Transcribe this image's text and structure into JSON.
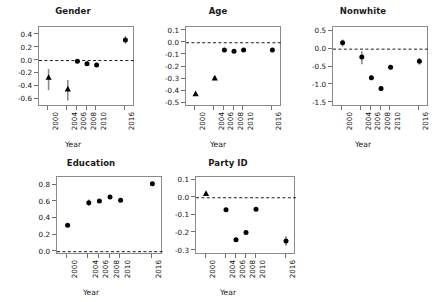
{
  "figure": {
    "xlabel": "Year",
    "years": [
      "2000",
      "2004",
      "2006",
      "2008",
      "2010",
      "2016"
    ]
  },
  "chart_data": [
    {
      "type": "scatter",
      "title": "Gender",
      "xlabel": "Year",
      "ylabel": "",
      "x": [
        2000,
        2004,
        2006,
        2008,
        2010,
        2016
      ],
      "categories": [
        "2000",
        "2004",
        "2006",
        "2008",
        "2010",
        "2016"
      ],
      "values": [
        -0.26,
        -0.44,
        -0.01,
        -0.05,
        -0.07,
        0.32
      ],
      "err_low": [
        -0.46,
        -0.62,
        -0.03,
        -0.08,
        -0.09,
        0.26
      ],
      "err_high": [
        -0.13,
        -0.3,
        0.01,
        -0.02,
        -0.05,
        0.38
      ],
      "markers": [
        "triangle",
        "triangle",
        "circle",
        "circle",
        "circle",
        "circle"
      ],
      "ylim": [
        -0.72,
        0.52
      ],
      "yticks": [
        "0.4",
        "0.2",
        "0.0",
        "-0.2",
        "-0.4",
        "-0.6"
      ],
      "ytick_values": [
        0.4,
        0.2,
        0.0,
        -0.2,
        -0.4,
        -0.6
      ],
      "reference_line": 0.0,
      "grid": false,
      "legend": "none"
    },
    {
      "type": "scatter",
      "title": "Age",
      "xlabel": "Year",
      "ylabel": "",
      "x": [
        2000,
        2004,
        2006,
        2008,
        2010,
        2016
      ],
      "categories": [
        "2000",
        "2004",
        "2006",
        "2008",
        "2010",
        "2016"
      ],
      "values": [
        -0.42,
        -0.29,
        -0.06,
        -0.07,
        -0.06,
        -0.06
      ],
      "err_low": [
        -0.435,
        -0.3,
        -0.072,
        -0.082,
        -0.072,
        -0.072
      ],
      "err_high": [
        -0.405,
        -0.28,
        -0.048,
        -0.058,
        -0.048,
        -0.048
      ],
      "markers": [
        "triangle",
        "triangle",
        "circle",
        "circle",
        "circle",
        "circle"
      ],
      "ylim": [
        -0.53,
        0.13
      ],
      "yticks": [
        "0.1",
        "0.0",
        "-0.1",
        "-0.2",
        "-0.3",
        "-0.4",
        "-0.5"
      ],
      "ytick_values": [
        0.1,
        0.0,
        -0.1,
        -0.2,
        -0.3,
        -0.4,
        -0.5
      ],
      "reference_line": 0.0,
      "grid": false,
      "legend": "none"
    },
    {
      "type": "scatter",
      "title": "Nonwhite",
      "xlabel": "Year",
      "ylabel": "",
      "x": [
        2000,
        2004,
        2006,
        2008,
        2010,
        2016
      ],
      "categories": [
        "2000",
        "2004",
        "2006",
        "2008",
        "2010",
        "2016"
      ],
      "values": [
        0.18,
        -0.22,
        -0.8,
        -1.1,
        -0.51,
        -0.34
      ],
      "err_low": [
        0.07,
        -0.42,
        -0.87,
        -1.17,
        -0.57,
        -0.44
      ],
      "err_high": [
        0.27,
        -0.06,
        -0.74,
        -1.03,
        -0.45,
        -0.25
      ],
      "markers": [
        "circle",
        "circle",
        "circle",
        "circle",
        "circle",
        "circle"
      ],
      "ylim": [
        -1.62,
        0.62
      ],
      "yticks": [
        "0.5",
        "0.0",
        "-0.5",
        "-1.0",
        "-1.5"
      ],
      "ytick_values": [
        0.5,
        0.0,
        -0.5,
        -1.0,
        -1.5
      ],
      "reference_line": 0.0,
      "grid": false,
      "legend": "none"
    },
    {
      "type": "scatter",
      "title": "Education",
      "xlabel": "Year",
      "ylabel": "",
      "x": [
        2000,
        2004,
        2006,
        2008,
        2010,
        2016
      ],
      "categories": [
        "2000",
        "2004",
        "2006",
        "2008",
        "2010",
        "2016"
      ],
      "values": [
        0.32,
        0.59,
        0.61,
        0.66,
        0.62,
        0.82
      ],
      "err_low": [
        0.3,
        0.55,
        0.59,
        0.64,
        0.6,
        0.8
      ],
      "err_high": [
        0.34,
        0.63,
        0.63,
        0.68,
        0.64,
        0.84
      ],
      "markers": [
        "circle",
        "circle",
        "circle",
        "circle",
        "circle",
        "circle"
      ],
      "ylim": [
        -0.04,
        0.9
      ],
      "yticks": [
        "0.8",
        "0.6",
        "0.4",
        "0.2",
        "0.0"
      ],
      "ytick_values": [
        0.8,
        0.6,
        0.4,
        0.2,
        0.0
      ],
      "reference_line": 0.0,
      "grid": false,
      "legend": "none"
    },
    {
      "type": "scatter",
      "title": "Party ID",
      "xlabel": "Year",
      "ylabel": "",
      "x": [
        2000,
        2004,
        2006,
        2008,
        2010,
        2016
      ],
      "categories": [
        "2000",
        "2004",
        "2006",
        "2008",
        "2010",
        "2016"
      ],
      "values": [
        0.025,
        -0.068,
        -0.238,
        -0.197,
        -0.065,
        -0.245
      ],
      "err_low": [
        0.018,
        -0.075,
        -0.248,
        -0.208,
        -0.073,
        -0.272
      ],
      "err_high": [
        0.032,
        -0.061,
        -0.228,
        -0.186,
        -0.057,
        -0.218
      ],
      "markers": [
        "triangle",
        "circle",
        "circle",
        "circle",
        "circle",
        "circle"
      ],
      "ylim": [
        -0.325,
        0.118
      ],
      "yticks": [
        "0.1",
        "0.0",
        "-0.1",
        "-0.2",
        "-0.3"
      ],
      "ytick_values": [
        0.1,
        0.0,
        -0.1,
        -0.2,
        -0.3
      ],
      "reference_line": 0.0,
      "grid": false,
      "legend": "none"
    }
  ]
}
